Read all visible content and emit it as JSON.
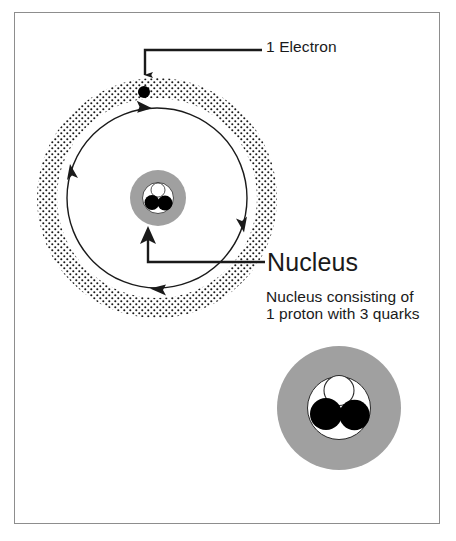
{
  "diagram": {
    "background_color": "#ffffff",
    "frame_color": "#8d8d8d",
    "labels": {
      "electron": "1 Electron",
      "nucleus_heading": "Nucleus",
      "nucleus_caption_line1": "Nucleus consisting of",
      "nucleus_caption_line2": "1 proton with 3 quarks"
    },
    "colors": {
      "gray_fill": "#a0a0a0",
      "black": "#000000",
      "white": "#ffffff",
      "stroke": "#1a1a1a"
    },
    "atom": {
      "center_x": 157,
      "center_y": 198,
      "electron_cloud_inner_radius": 100,
      "electron_cloud_outer_radius": 120,
      "orbit_radius": 90,
      "electron_dot_radius": 6,
      "electron_dot_x": 144,
      "electron_dot_y": 92,
      "nucleus_radius": 28,
      "nucleus_inner_radius": 15,
      "quark_count": 3
    },
    "proton_detail": {
      "center_x": 339,
      "center_y": 408,
      "outer_radius": 62,
      "inner_radius": 31,
      "quarks": [
        {
          "name": "quark-top",
          "fill": "#ffffff",
          "cx": 339,
          "cy": 390,
          "r": 15
        },
        {
          "name": "quark-bottom-left",
          "fill": "#000000",
          "cx": 326,
          "cy": 414,
          "r": 16
        },
        {
          "name": "quark-bottom-right",
          "fill": "#000000",
          "cx": 354,
          "cy": 415,
          "r": 15
        }
      ]
    },
    "annotations": [
      {
        "name": "electron-pointer",
        "target": "electron dot",
        "direction": "down"
      },
      {
        "name": "nucleus-pointer",
        "target": "nucleus",
        "direction": "up"
      }
    ]
  }
}
